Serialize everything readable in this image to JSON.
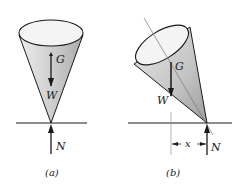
{
  "figure_a": {
    "caption": "(a)",
    "labels": {
      "center_of_gravity": "G",
      "weight": "W",
      "normal": "N"
    }
  },
  "figure_b": {
    "caption": "(b)",
    "labels": {
      "center_of_gravity": "G",
      "weight": "W",
      "normal": "N",
      "offset": "x"
    }
  },
  "colors": {
    "line": "#1a1a1a",
    "cone_fill": "#d4d4d4",
    "cone_top": "#f2f2f2",
    "axis": "#777777"
  }
}
